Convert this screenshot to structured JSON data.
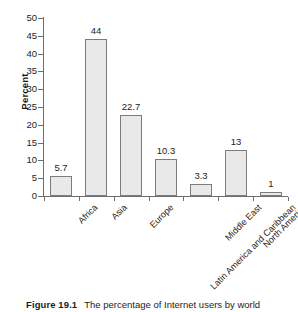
{
  "caption": {
    "number": "Figure 19.1",
    "text": "The percentage of Internet users by world"
  },
  "chart_data": {
    "type": "bar",
    "title": "",
    "xlabel": "",
    "ylabel": "Percent",
    "ylim": [
      0,
      50
    ],
    "ytick_step": 5,
    "yticks": [
      50,
      45,
      40,
      35,
      30,
      25,
      20,
      15,
      10,
      5,
      0
    ],
    "ytick_labels": [
      "50",
      "45",
      "40",
      "35",
      "30",
      "25",
      "20",
      "15",
      "10",
      "5",
      "0"
    ],
    "grid": false,
    "legend": false,
    "bar_fill": "#e9e9e9",
    "bar_border": "#7c7c7c",
    "categories": [
      "Africa",
      "Asia",
      "Europe",
      "Latin America and Caribbean",
      "Middle East",
      "North America",
      "Oceania and Australia"
    ],
    "values": [
      5.7,
      44,
      22.7,
      10.3,
      3.3,
      13,
      1
    ],
    "value_labels": [
      "5.7",
      "44",
      "22.7",
      "10.3",
      "3.3",
      "13",
      "1"
    ]
  }
}
